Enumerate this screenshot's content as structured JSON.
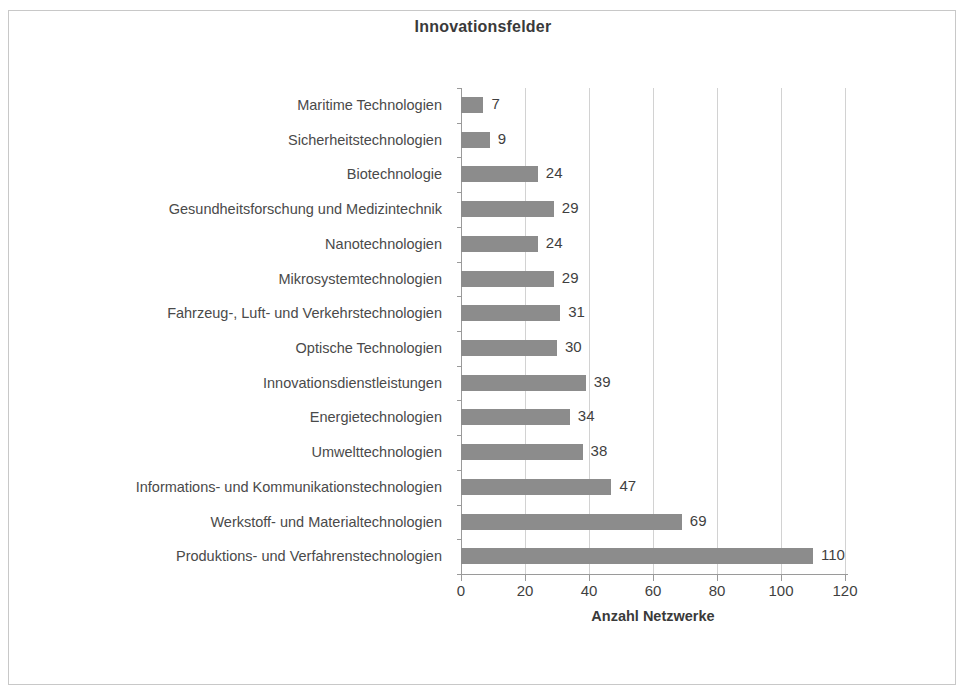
{
  "chart_data": {
    "type": "bar",
    "orientation": "horizontal",
    "title": "Innovationsfelder",
    "xlabel": "Anzahl Netzwerke",
    "ylabel": "",
    "xlim": [
      0,
      120
    ],
    "xticks": [
      0,
      20,
      40,
      60,
      80,
      100,
      120
    ],
    "grid": true,
    "legend": false,
    "bar_color": "#8c8c8c",
    "categories": [
      "Maritime Technologien",
      "Sicherheitstechnologien",
      "Biotechnologie",
      "Gesundheitsforschung und Medizintechnik",
      "Nanotechnologien",
      "Mikrosystemtechnologien",
      "Fahrzeug-, Luft- und Verkehrstechnologien",
      "Optische Technologien",
      "Innovationsdienstleistungen",
      "Energietechnologien",
      "Umwelttechnologien",
      "Informations- und Kommunikationstechnologien",
      "Werkstoff- und Materialtechnologien",
      "Produktions- und Verfahrenstechnologien"
    ],
    "values": [
      7,
      9,
      24,
      29,
      24,
      29,
      31,
      30,
      39,
      34,
      38,
      47,
      69,
      110
    ],
    "data_labels": [
      "7",
      "9",
      "24",
      "29",
      "24",
      "29",
      "31",
      "30",
      "39",
      "34",
      "38",
      "47",
      "69",
      "110"
    ],
    "tick_labels": [
      "0",
      "20",
      "40",
      "60",
      "80",
      "100",
      "120"
    ]
  }
}
